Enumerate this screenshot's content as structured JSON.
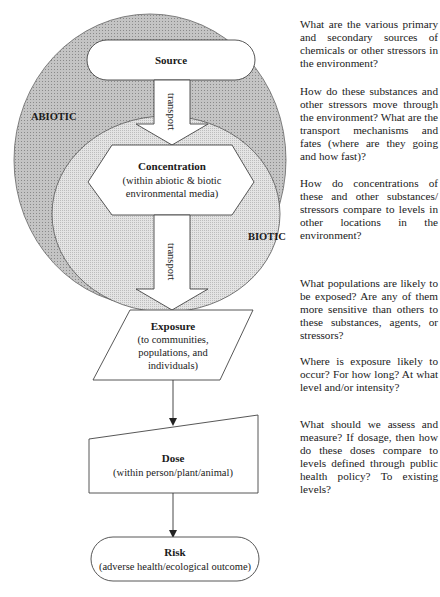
{
  "diagram": {
    "regions": {
      "outer": {
        "label": "ABIOTIC",
        "fill": "#bdbdbd"
      },
      "inner": {
        "label": "BIOTIC",
        "fill": "#dcdcdc"
      }
    },
    "nodes": [
      {
        "id": "source",
        "shape": "rounded-pill",
        "title": "Source",
        "subtitle": ""
      },
      {
        "id": "concentration",
        "shape": "hexagon",
        "title": "Concentration",
        "subtitle_lines": [
          "(within abiotic & biotic",
          "environmental media)"
        ]
      },
      {
        "id": "exposure",
        "shape": "parallelogram",
        "title": "Exposure",
        "subtitle_lines": [
          "(to communities,",
          "populations, and",
          "individuals)"
        ]
      },
      {
        "id": "dose",
        "shape": "trapezoid",
        "title": "Dose",
        "subtitle_lines": [
          "(within person/plant/animal)"
        ]
      },
      {
        "id": "risk",
        "shape": "rounded-pill",
        "title": "Risk",
        "subtitle_lines": [
          "(adverse health/ecological outcome)"
        ]
      }
    ],
    "arrows": [
      {
        "from": "source",
        "to": "concentration",
        "style": "block-arrow",
        "label": "transport"
      },
      {
        "from": "concentration",
        "to": "exposure",
        "style": "block-arrow",
        "label": "transport"
      },
      {
        "from": "exposure",
        "to": "dose",
        "style": "line-arrow",
        "label": ""
      },
      {
        "from": "dose",
        "to": "risk",
        "style": "line-arrow",
        "label": ""
      }
    ]
  },
  "questions": [
    {
      "id": "q-source",
      "text": "What are the various primary and secondary sources of chemicals or other stressors in the environment?"
    },
    {
      "id": "q-transport",
      "text": "How do these substances and other stressors move through the environment?  What are the transport mechanisms and fates (where are they going and how fast)?"
    },
    {
      "id": "q-concentration",
      "text": "How do concentrations of these and other substances/ stressors compare to levels in other locations in the environment?"
    },
    {
      "id": "q-populations",
      "text": "What populations are likely to be exposed?  Are any of them more sensitive than others to these substances, agents, or stressors?"
    },
    {
      "id": "q-exposure",
      "text": "Where is exposure likely to occur?  For how long?  At what level and/or intensity?"
    },
    {
      "id": "q-dose",
      "text": "What should we assess and measure?  If dosage, then how do these doses compare to levels defined through public health policy?  To existing levels?"
    }
  ]
}
